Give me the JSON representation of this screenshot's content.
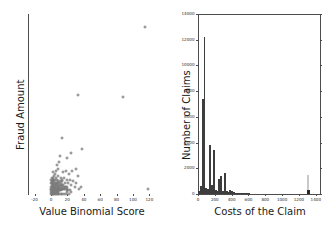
{
  "figure": {
    "background": "#ffffff",
    "axis_color": "#4d4d4d",
    "marker_color": "#7a7a7a",
    "bar_color": "#3d3d3d"
  },
  "chart_data": [
    {
      "type": "scatter",
      "title": "",
      "xlabel": "Value Binomial Score",
      "ylabel": "Fraud Amount",
      "xlim": [
        -28,
        128
      ],
      "ylim": [
        0,
        100
      ],
      "xticks": [
        -20,
        0,
        20,
        40,
        60,
        80,
        100,
        120
      ],
      "xticklabels": [
        "-20",
        "0",
        "20",
        "40",
        "60",
        "80",
        "100",
        "120"
      ],
      "yticks": [],
      "yticklabels": [],
      "grid": false,
      "legend": null,
      "marker": "open-circle",
      "points": [
        [
          115,
          93
        ],
        [
          33,
          55
        ],
        [
          88,
          54
        ],
        [
          118,
          3
        ],
        [
          13,
          31
        ],
        [
          38,
          25
        ],
        [
          25,
          23
        ],
        [
          20,
          20
        ],
        [
          11,
          21
        ],
        [
          10,
          18
        ],
        [
          30,
          14
        ],
        [
          26,
          13
        ],
        [
          18,
          13
        ],
        [
          33,
          10
        ],
        [
          22,
          11
        ],
        [
          15,
          12
        ],
        [
          9,
          14
        ],
        [
          7,
          16
        ],
        [
          6,
          13
        ],
        [
          5,
          11
        ],
        [
          12,
          9
        ],
        [
          16,
          9
        ],
        [
          20,
          8
        ],
        [
          27,
          7
        ],
        [
          8,
          10
        ],
        [
          6,
          9
        ],
        [
          4,
          10
        ],
        [
          3,
          12
        ],
        [
          2,
          9
        ],
        [
          5,
          8
        ],
        [
          7,
          8
        ],
        [
          9,
          7
        ],
        [
          11,
          7
        ],
        [
          14,
          7
        ],
        [
          17,
          6
        ],
        [
          21,
          6
        ],
        [
          24,
          5
        ],
        [
          29,
          4
        ],
        [
          34,
          3
        ],
        [
          2,
          7
        ],
        [
          3,
          8
        ],
        [
          4,
          7
        ],
        [
          5,
          6
        ],
        [
          6,
          6
        ],
        [
          7,
          6
        ],
        [
          8,
          6
        ],
        [
          9,
          5
        ],
        [
          10,
          6
        ],
        [
          11,
          5
        ],
        [
          12,
          5
        ],
        [
          13,
          5
        ],
        [
          14,
          4
        ],
        [
          15,
          5
        ],
        [
          16,
          4
        ],
        [
          17,
          4
        ],
        [
          18,
          4
        ],
        [
          19,
          4
        ],
        [
          20,
          3
        ],
        [
          1,
          9
        ],
        [
          1,
          7
        ],
        [
          2,
          6
        ],
        [
          3,
          6
        ],
        [
          4,
          5
        ],
        [
          5,
          5
        ],
        [
          6,
          5
        ],
        [
          7,
          5
        ],
        [
          8,
          4
        ],
        [
          9,
          4
        ],
        [
          10,
          4
        ],
        [
          11,
          4
        ],
        [
          12,
          3
        ],
        [
          13,
          3
        ],
        [
          14,
          3
        ],
        [
          15,
          3
        ],
        [
          16,
          3
        ],
        [
          17,
          3
        ],
        [
          1,
          5
        ],
        [
          2,
          5
        ],
        [
          3,
          4
        ],
        [
          4,
          4
        ],
        [
          5,
          4
        ],
        [
          6,
          4
        ],
        [
          7,
          3
        ],
        [
          8,
          3
        ],
        [
          9,
          3
        ],
        [
          10,
          3
        ],
        [
          11,
          2
        ],
        [
          12,
          2
        ],
        [
          0,
          6
        ],
        [
          0,
          4
        ],
        [
          1,
          4
        ],
        [
          2,
          4
        ],
        [
          3,
          3
        ],
        [
          4,
          3
        ],
        [
          5,
          3
        ],
        [
          6,
          3
        ],
        [
          7,
          2
        ],
        [
          8,
          2
        ],
        [
          9,
          2
        ],
        [
          10,
          2
        ],
        [
          0,
          3
        ],
        [
          1,
          3
        ],
        [
          2,
          3
        ],
        [
          3,
          2
        ],
        [
          4,
          2
        ],
        [
          5,
          2
        ],
        [
          6,
          2
        ],
        [
          7,
          1
        ],
        [
          0,
          2
        ],
        [
          1,
          2
        ],
        [
          2,
          2
        ],
        [
          3,
          1
        ],
        [
          4,
          1
        ],
        [
          5,
          1
        ],
        [
          6,
          1
        ],
        [
          8,
          1
        ],
        [
          0,
          1
        ],
        [
          1,
          1
        ],
        [
          2,
          1
        ],
        [
          9,
          1
        ],
        [
          0,
          0
        ],
        [
          1,
          0
        ],
        [
          2,
          0
        ],
        [
          3,
          0
        ],
        [
          4,
          0
        ],
        [
          5,
          0
        ],
        [
          6,
          0
        ],
        [
          7,
          0
        ],
        [
          8,
          0
        ],
        [
          10,
          0
        ],
        [
          12,
          0
        ],
        [
          14,
          0
        ],
        [
          16,
          0
        ],
        [
          18,
          0
        ],
        [
          20,
          1
        ],
        [
          22,
          0
        ],
        [
          24,
          1
        ],
        [
          0,
          8
        ],
        [
          1,
          6
        ],
        [
          2,
          8
        ],
        [
          19,
          2
        ],
        [
          21,
          2
        ],
        [
          23,
          2
        ],
        [
          12,
          6
        ],
        [
          13,
          8
        ],
        [
          23,
          8
        ],
        [
          31,
          6
        ],
        [
          36,
          4
        ]
      ]
    },
    {
      "type": "bar",
      "title": "",
      "xlabel": "Costs of the Claim",
      "ylabel": "Number of Claims",
      "xlim": [
        0,
        1450
      ],
      "ylim": [
        0,
        14000
      ],
      "xticks": [
        0,
        200,
        400,
        600,
        800,
        1000,
        1200,
        1400
      ],
      "xticklabels": [
        "0",
        "200",
        "400",
        "600",
        "800",
        "1000",
        "1200",
        "1400"
      ],
      "yticks": [
        0,
        2000,
        4000,
        6000,
        8000,
        10000,
        12000,
        14000
      ],
      "yticklabels": [
        "0",
        "2000",
        "4000",
        "6000",
        "8000",
        "10000",
        "12000",
        "14000"
      ],
      "grid": false,
      "legend": null,
      "bin_width": 22,
      "categories": [
        11,
        33,
        55,
        77,
        99,
        121,
        143,
        165,
        187,
        209,
        231,
        253,
        275,
        297,
        319,
        341,
        363,
        385,
        407,
        429,
        451,
        473,
        495,
        517,
        539,
        561,
        583,
        605,
        1309
      ],
      "values": [
        250,
        650,
        7400,
        12200,
        480,
        420,
        3800,
        700,
        3400,
        330,
        250,
        1200,
        1400,
        240,
        1650,
        200,
        160,
        330,
        260,
        120,
        90,
        60,
        50,
        40,
        30,
        25,
        20,
        15,
        1450
      ]
    }
  ]
}
